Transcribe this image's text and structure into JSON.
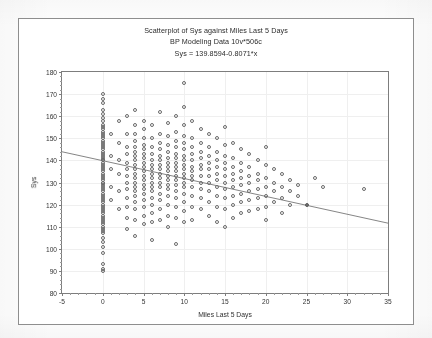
{
  "chart_data": {
    "type": "scatter",
    "title": "Scatterplot of Sys against Miles Last 5 Days",
    "subtitle": "BP Modeling Data 10v*506c",
    "equation": "Sys = 139.8594-0.8071*x",
    "xlabel": "Miles Last 5 Days",
    "ylabel": "Sys",
    "xlim": [
      -5,
      35
    ],
    "ylim": [
      80,
      180
    ],
    "xticks": [
      -5,
      0,
      5,
      10,
      15,
      20,
      25,
      30,
      35
    ],
    "yticks": [
      80,
      90,
      100,
      110,
      120,
      130,
      140,
      150,
      160,
      170,
      180
    ],
    "xtick_labels": [
      "-5",
      "0",
      "5",
      "10",
      "15",
      "20",
      "25",
      "30",
      "35"
    ],
    "ytick_labels": [
      "80",
      "90",
      "100",
      "110",
      "120",
      "130",
      "140",
      "150",
      "160",
      "170",
      "180"
    ],
    "grid": true,
    "legend": "none",
    "marker": "open-circle",
    "marker_color": "#6a6a6a",
    "fit_line": {
      "intercept": 139.8594,
      "slope": -0.8071,
      "color": "#777777",
      "x_start": -5,
      "x_end": 35,
      "y_start": 143.9,
      "y_end": 111.6
    },
    "points": [
      [
        0,
        170
      ],
      [
        0,
        168
      ],
      [
        0,
        166
      ],
      [
        0,
        163
      ],
      [
        0,
        161
      ],
      [
        0,
        159
      ],
      [
        0,
        158
      ],
      [
        0,
        156
      ],
      [
        0,
        155
      ],
      [
        0,
        154
      ],
      [
        0,
        153
      ],
      [
        0,
        152
      ],
      [
        0,
        151
      ],
      [
        0,
        150
      ],
      [
        0,
        149
      ],
      [
        0,
        148
      ],
      [
        0,
        147
      ],
      [
        0,
        146
      ],
      [
        0,
        145
      ],
      [
        0,
        144
      ],
      [
        0,
        143
      ],
      [
        0,
        142
      ],
      [
        0,
        141
      ],
      [
        0,
        140
      ],
      [
        0,
        140
      ],
      [
        0,
        139
      ],
      [
        0,
        138
      ],
      [
        0,
        137
      ],
      [
        0,
        136
      ],
      [
        0,
        135
      ],
      [
        0,
        134
      ],
      [
        0,
        133
      ],
      [
        0,
        132
      ],
      [
        0,
        131
      ],
      [
        0,
        130
      ],
      [
        0,
        130
      ],
      [
        0,
        129
      ],
      [
        0,
        128
      ],
      [
        0,
        127
      ],
      [
        0,
        126
      ],
      [
        0,
        125
      ],
      [
        0,
        124
      ],
      [
        0,
        123
      ],
      [
        0,
        122
      ],
      [
        0,
        121
      ],
      [
        0,
        120
      ],
      [
        0,
        119
      ],
      [
        0,
        118
      ],
      [
        0,
        117
      ],
      [
        0,
        116
      ],
      [
        0,
        115
      ],
      [
        0,
        114
      ],
      [
        0,
        113
      ],
      [
        0,
        112
      ],
      [
        0,
        111
      ],
      [
        0,
        110
      ],
      [
        0,
        109
      ],
      [
        0,
        108
      ],
      [
        0,
        107
      ],
      [
        0,
        105
      ],
      [
        0,
        103
      ],
      [
        0,
        101
      ],
      [
        0,
        98
      ],
      [
        0,
        93
      ],
      [
        0,
        91
      ],
      [
        0,
        90
      ],
      [
        1,
        152
      ],
      [
        1,
        142
      ],
      [
        1,
        136
      ],
      [
        1,
        128
      ],
      [
        1,
        122
      ],
      [
        2,
        158
      ],
      [
        2,
        148
      ],
      [
        2,
        140
      ],
      [
        2,
        134
      ],
      [
        2,
        126
      ],
      [
        2,
        118
      ],
      [
        3,
        160
      ],
      [
        3,
        152
      ],
      [
        3,
        146
      ],
      [
        3,
        143
      ],
      [
        3,
        139
      ],
      [
        3,
        136
      ],
      [
        3,
        133
      ],
      [
        3,
        130
      ],
      [
        3,
        127
      ],
      [
        3,
        123
      ],
      [
        3,
        119
      ],
      [
        3,
        114
      ],
      [
        3,
        109
      ],
      [
        4,
        163
      ],
      [
        4,
        156
      ],
      [
        4,
        152
      ],
      [
        4,
        149
      ],
      [
        4,
        146
      ],
      [
        4,
        144
      ],
      [
        4,
        142
      ],
      [
        4,
        140
      ],
      [
        4,
        138
      ],
      [
        4,
        136
      ],
      [
        4,
        134
      ],
      [
        4,
        132
      ],
      [
        4,
        130
      ],
      [
        4,
        128
      ],
      [
        4,
        126
      ],
      [
        4,
        124
      ],
      [
        4,
        121
      ],
      [
        4,
        118
      ],
      [
        4,
        113
      ],
      [
        4,
        106
      ],
      [
        5,
        158
      ],
      [
        5,
        154
      ],
      [
        5,
        150
      ],
      [
        5,
        147
      ],
      [
        5,
        145
      ],
      [
        5,
        143
      ],
      [
        5,
        141
      ],
      [
        5,
        139
      ],
      [
        5,
        137
      ],
      [
        5,
        135
      ],
      [
        5,
        133
      ],
      [
        5,
        131
      ],
      [
        5,
        129
      ],
      [
        5,
        127
      ],
      [
        5,
        125
      ],
      [
        5,
        122
      ],
      [
        5,
        119
      ],
      [
        5,
        115
      ],
      [
        5,
        111
      ],
      [
        6,
        156
      ],
      [
        6,
        150
      ],
      [
        6,
        146
      ],
      [
        6,
        143
      ],
      [
        6,
        140
      ],
      [
        6,
        138
      ],
      [
        6,
        136
      ],
      [
        6,
        134
      ],
      [
        6,
        132
      ],
      [
        6,
        130
      ],
      [
        6,
        128
      ],
      [
        6,
        126
      ],
      [
        6,
        123
      ],
      [
        6,
        120
      ],
      [
        6,
        116
      ],
      [
        6,
        112
      ],
      [
        6,
        104
      ],
      [
        7,
        162
      ],
      [
        7,
        152
      ],
      [
        7,
        148
      ],
      [
        7,
        145
      ],
      [
        7,
        142
      ],
      [
        7,
        140
      ],
      [
        7,
        138
      ],
      [
        7,
        136
      ],
      [
        7,
        134
      ],
      [
        7,
        132
      ],
      [
        7,
        130
      ],
      [
        7,
        128
      ],
      [
        7,
        125
      ],
      [
        7,
        122
      ],
      [
        7,
        118
      ],
      [
        7,
        113
      ],
      [
        8,
        157
      ],
      [
        8,
        151
      ],
      [
        8,
        147
      ],
      [
        8,
        144
      ],
      [
        8,
        141
      ],
      [
        8,
        139
      ],
      [
        8,
        137
      ],
      [
        8,
        135
      ],
      [
        8,
        133
      ],
      [
        8,
        131
      ],
      [
        8,
        129
      ],
      [
        8,
        127
      ],
      [
        8,
        124
      ],
      [
        8,
        120
      ],
      [
        8,
        115
      ],
      [
        8,
        110
      ],
      [
        9,
        160
      ],
      [
        9,
        153
      ],
      [
        9,
        149
      ],
      [
        9,
        146
      ],
      [
        9,
        143
      ],
      [
        9,
        141
      ],
      [
        9,
        139
      ],
      [
        9,
        137
      ],
      [
        9,
        135
      ],
      [
        9,
        133
      ],
      [
        9,
        131
      ],
      [
        9,
        129
      ],
      [
        9,
        126
      ],
      [
        9,
        123
      ],
      [
        9,
        119
      ],
      [
        9,
        114
      ],
      [
        9,
        102
      ],
      [
        10,
        175
      ],
      [
        10,
        164
      ],
      [
        10,
        156
      ],
      [
        10,
        151
      ],
      [
        10,
        148
      ],
      [
        10,
        145
      ],
      [
        10,
        142
      ],
      [
        10,
        140
      ],
      [
        10,
        138
      ],
      [
        10,
        136
      ],
      [
        10,
        134
      ],
      [
        10,
        132
      ],
      [
        10,
        130
      ],
      [
        10,
        128
      ],
      [
        10,
        125
      ],
      [
        10,
        121
      ],
      [
        10,
        117
      ],
      [
        10,
        112
      ],
      [
        11,
        158
      ],
      [
        11,
        150
      ],
      [
        11,
        146
      ],
      [
        11,
        143
      ],
      [
        11,
        140
      ],
      [
        11,
        137
      ],
      [
        11,
        135
      ],
      [
        11,
        133
      ],
      [
        11,
        131
      ],
      [
        11,
        128
      ],
      [
        11,
        124
      ],
      [
        11,
        119
      ],
      [
        11,
        113
      ],
      [
        12,
        154
      ],
      [
        12,
        148
      ],
      [
        12,
        144
      ],
      [
        12,
        141
      ],
      [
        12,
        138
      ],
      [
        12,
        136
      ],
      [
        12,
        133
      ],
      [
        12,
        130
      ],
      [
        12,
        127
      ],
      [
        12,
        123
      ],
      [
        12,
        118
      ],
      [
        13,
        152
      ],
      [
        13,
        146
      ],
      [
        13,
        142
      ],
      [
        13,
        139
      ],
      [
        13,
        136
      ],
      [
        13,
        133
      ],
      [
        13,
        130
      ],
      [
        13,
        126
      ],
      [
        13,
        121
      ],
      [
        13,
        115
      ],
      [
        14,
        150
      ],
      [
        14,
        144
      ],
      [
        14,
        140
      ],
      [
        14,
        137
      ],
      [
        14,
        134
      ],
      [
        14,
        131
      ],
      [
        14,
        128
      ],
      [
        14,
        124
      ],
      [
        14,
        119
      ],
      [
        14,
        112
      ],
      [
        15,
        155
      ],
      [
        15,
        147
      ],
      [
        15,
        142
      ],
      [
        15,
        139
      ],
      [
        15,
        136
      ],
      [
        15,
        133
      ],
      [
        15,
        130
      ],
      [
        15,
        127
      ],
      [
        15,
        123
      ],
      [
        15,
        118
      ],
      [
        15,
        110
      ],
      [
        16,
        148
      ],
      [
        16,
        141
      ],
      [
        16,
        137
      ],
      [
        16,
        134
      ],
      [
        16,
        131
      ],
      [
        16,
        128
      ],
      [
        16,
        124
      ],
      [
        16,
        120
      ],
      [
        16,
        114
      ],
      [
        17,
        145
      ],
      [
        17,
        139
      ],
      [
        17,
        135
      ],
      [
        17,
        132
      ],
      [
        17,
        129
      ],
      [
        17,
        125
      ],
      [
        17,
        121
      ],
      [
        17,
        116
      ],
      [
        18,
        143
      ],
      [
        18,
        137
      ],
      [
        18,
        133
      ],
      [
        18,
        130
      ],
      [
        18,
        126
      ],
      [
        18,
        122
      ],
      [
        18,
        117
      ],
      [
        19,
        140
      ],
      [
        19,
        134
      ],
      [
        19,
        131
      ],
      [
        19,
        127
      ],
      [
        19,
        123
      ],
      [
        19,
        118
      ],
      [
        20,
        146
      ],
      [
        20,
        138
      ],
      [
        20,
        132
      ],
      [
        20,
        128
      ],
      [
        20,
        124
      ],
      [
        20,
        119
      ],
      [
        20,
        113
      ],
      [
        21,
        136
      ],
      [
        21,
        130
      ],
      [
        21,
        126
      ],
      [
        21,
        121
      ],
      [
        22,
        134
      ],
      [
        22,
        128
      ],
      [
        22,
        123
      ],
      [
        22,
        116
      ],
      [
        23,
        131
      ],
      [
        23,
        126
      ],
      [
        23,
        120
      ],
      [
        24,
        129
      ],
      [
        24,
        124
      ],
      [
        25,
        120
      ],
      [
        26,
        132
      ],
      [
        27,
        128
      ],
      [
        32,
        127
      ]
    ],
    "highlight_points": [
      [
        25,
        120
      ]
    ]
  }
}
